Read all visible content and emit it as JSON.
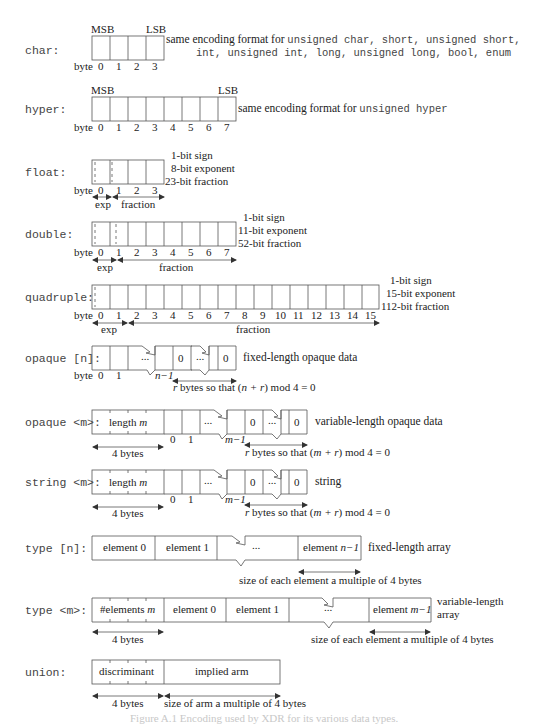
{
  "rows": {
    "char": {
      "label": "char:",
      "msb": "MSB",
      "lsb": "LSB",
      "byte_label": "byte",
      "bytes": [
        "0",
        "1",
        "2",
        "3"
      ],
      "desc_line1_prefix": "same encoding format for ",
      "desc_line1_types": "unsigned char, short, unsigned short,",
      "desc_line2_types": "int, unsigned int, long, unsigned long, bool, enum"
    },
    "hyper": {
      "label": "hyper:",
      "msb": "MSB",
      "lsb": "LSB",
      "byte_label": "byte",
      "bytes": [
        "0",
        "1",
        "2",
        "3",
        "4",
        "5",
        "6",
        "7"
      ],
      "desc_prefix": "same encoding format for ",
      "desc_type": "unsigned hyper"
    },
    "float": {
      "label": "float:",
      "byte_label": "byte",
      "bytes": [
        "0",
        "1",
        "2",
        "3"
      ],
      "notes": [
        "1-bit sign",
        "8-bit exponent",
        "23-bit fraction"
      ],
      "exp_label": "exp",
      "fraction_label": "fraction"
    },
    "double": {
      "label": "double:",
      "byte_label": "byte",
      "bytes": [
        "0",
        "1",
        "2",
        "3",
        "4",
        "5",
        "6",
        "7"
      ],
      "notes": [
        "1-bit sign",
        "11-bit exponent",
        "52-bit fraction"
      ],
      "exp_label": "exp",
      "fraction_label": "fraction"
    },
    "quadruple": {
      "label": "quadruple:",
      "byte_label": "byte",
      "bytes": [
        "0",
        "1",
        "2",
        "3",
        "4",
        "5",
        "6",
        "7",
        "8",
        "9",
        "10",
        "11",
        "12",
        "13",
        "14",
        "15"
      ],
      "notes": [
        "1-bit sign",
        "15-bit exponent",
        "112-bit fraction"
      ],
      "exp_label": "exp",
      "fraction_label": "fraction"
    },
    "opaque_fixed": {
      "label": "opaque [n]:",
      "cells": [
        "",
        "",
        "...",
        "",
        "0",
        "...",
        "0"
      ],
      "byte_label": "byte",
      "b0": "0",
      "b1": "1",
      "bn": "n−1",
      "desc": "fixed-length opaque data",
      "pad_note_pre": "r bytes so that (",
      "pad_note_expr": "n + r",
      "pad_note_post": ") mod 4 = 0"
    },
    "opaque_var": {
      "label": "opaque <m>:",
      "length_cell": "length ",
      "length_var": "m",
      "cells": [
        "",
        "",
        "...",
        "",
        "0",
        "...",
        "0"
      ],
      "b0": "0",
      "b1": "1",
      "bm": "m−1",
      "four_bytes": "4 bytes",
      "desc": "variable-length opaque data",
      "pad_note_pre": "r bytes so that (",
      "pad_note_expr": "m + r",
      "pad_note_post": ") mod 4 = 0"
    },
    "string": {
      "label": "string <m>:",
      "length_cell": "length ",
      "length_var": "m",
      "cells": [
        "",
        "",
        "...",
        "",
        "0",
        "...",
        "0"
      ],
      "b0": "0",
      "b1": "1",
      "bm": "m−1",
      "four_bytes": "4 bytes",
      "desc": "string",
      "pad_note_pre": "r bytes so that (",
      "pad_note_expr": "m + r",
      "pad_note_post": ") mod 4 = 0"
    },
    "array_fixed": {
      "label": "type [n]:",
      "cells": [
        "element 0",
        "element 1",
        "...",
        "element "
      ],
      "last_var": "n−1",
      "desc": "fixed-length array",
      "size_note": "size of each element a multiple of 4 bytes"
    },
    "array_var": {
      "label": "type <m>:",
      "count_cell": "#elements ",
      "count_var": "m",
      "cells": [
        "element 0",
        "element 1",
        "...",
        "element "
      ],
      "last_var": "m−1",
      "desc_line1": "variable-length",
      "desc_line2": "array",
      "four_bytes": "4 bytes",
      "size_note": "size of each element a multiple of 4 bytes"
    },
    "union": {
      "label": "union:",
      "cells": [
        "discriminant",
        "implied arm"
      ],
      "four_bytes": "4 bytes",
      "size_note": "size of arm a multiple of 4 bytes"
    }
  },
  "caption": "Figure A.1 Encoding used by XDR for its various data types."
}
